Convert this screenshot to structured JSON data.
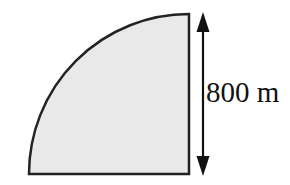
{
  "figure": {
    "corner_label": "c",
    "shape": "quarter-circle",
    "dimension_label": "800 m",
    "fill_color": "#e9e9e9",
    "stroke_color": "#222222",
    "arrow_color": "#111111",
    "background_color": "#ffffff"
  }
}
